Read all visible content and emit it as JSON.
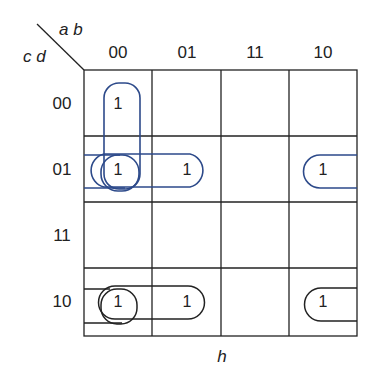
{
  "kmap": {
    "row_var": "c d",
    "col_var": "a b",
    "caption": "h",
    "col_labels": [
      "00",
      "01",
      "11",
      "10"
    ],
    "row_labels": [
      "00",
      "01",
      "11",
      "10"
    ],
    "cells": [
      [
        "1",
        "",
        "",
        ""
      ],
      [
        "1",
        "1",
        "",
        "1"
      ],
      [
        "",
        "",
        "",
        ""
      ],
      [
        "1",
        "1",
        "",
        "1"
      ]
    ],
    "colors": {
      "blue_loop": "#2d4a8a",
      "black_loop": "#222222",
      "grid": "#222222"
    }
  }
}
